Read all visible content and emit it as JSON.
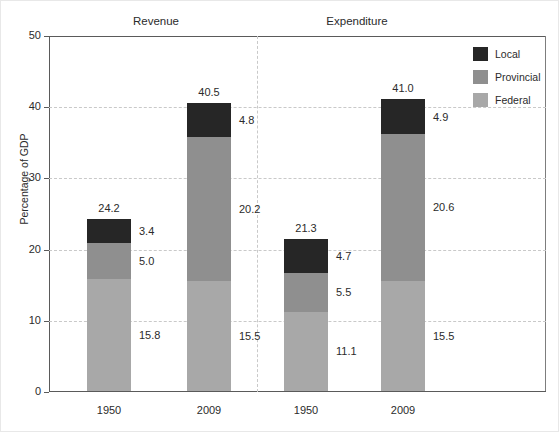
{
  "chart_data": {
    "type": "bar",
    "subtype": "stacked-bar-grouped-panels",
    "title": "",
    "xlabel": "",
    "ylabel": "Percentage of GDP",
    "ylim": [
      0,
      50
    ],
    "yticks": [
      0,
      10,
      20,
      30,
      40,
      50
    ],
    "grid": "horizontal-dashed",
    "legend_position": "top-right",
    "panels": [
      "Revenue",
      "Expenditure"
    ],
    "categories": [
      "1950",
      "2009",
      "1950",
      "2009"
    ],
    "series": [
      {
        "name": "Federal",
        "color": "#a8a8a8",
        "values": [
          15.8,
          15.5,
          11.1,
          15.5
        ]
      },
      {
        "name": "Provincial",
        "color": "#8f8f8f",
        "values": [
          5.0,
          20.2,
          5.5,
          20.6
        ]
      },
      {
        "name": "Local",
        "color": "#262626",
        "values": [
          3.4,
          4.8,
          4.7,
          4.9
        ]
      }
    ],
    "totals": [
      24.2,
      40.5,
      21.3,
      41.0
    ],
    "bars": [
      {
        "panel": "Revenue",
        "category": "1950",
        "total": "24.2",
        "segments": [
          {
            "series": "Federal",
            "value": "15.8"
          },
          {
            "series": "Provincial",
            "value": "5.0"
          },
          {
            "series": "Local",
            "value": "3.4"
          }
        ]
      },
      {
        "panel": "Revenue",
        "category": "2009",
        "total": "40.5",
        "segments": [
          {
            "series": "Federal",
            "value": "15.5"
          },
          {
            "series": "Provincial",
            "value": "20.2"
          },
          {
            "series": "Local",
            "value": "4.8"
          }
        ]
      },
      {
        "panel": "Expenditure",
        "category": "1950",
        "total": "21.3",
        "segments": [
          {
            "series": "Federal",
            "value": "11.1"
          },
          {
            "series": "Provincial",
            "value": "5.5"
          },
          {
            "series": "Local",
            "value": "4.7"
          }
        ]
      },
      {
        "panel": "Expenditure",
        "category": "2009",
        "total": "41.0",
        "segments": [
          {
            "series": "Federal",
            "value": "15.5"
          },
          {
            "series": "Provincial",
            "value": "20.6"
          },
          {
            "series": "Local",
            "value": "4.9"
          }
        ]
      }
    ]
  },
  "axis": {
    "y_label": "Percentage of GDP",
    "y_ticks": [
      "0",
      "10",
      "20",
      "30",
      "40",
      "50"
    ],
    "x_ticks": [
      "1950",
      "2009",
      "1950",
      "2009"
    ]
  },
  "panel_titles": [
    "Revenue",
    "Expenditure"
  ],
  "legend": {
    "items": [
      {
        "label": "Local",
        "color": "#262626"
      },
      {
        "label": "Provincial",
        "color": "#8f8f8f"
      },
      {
        "label": "Federal",
        "color": "#a8a8a8"
      }
    ]
  }
}
